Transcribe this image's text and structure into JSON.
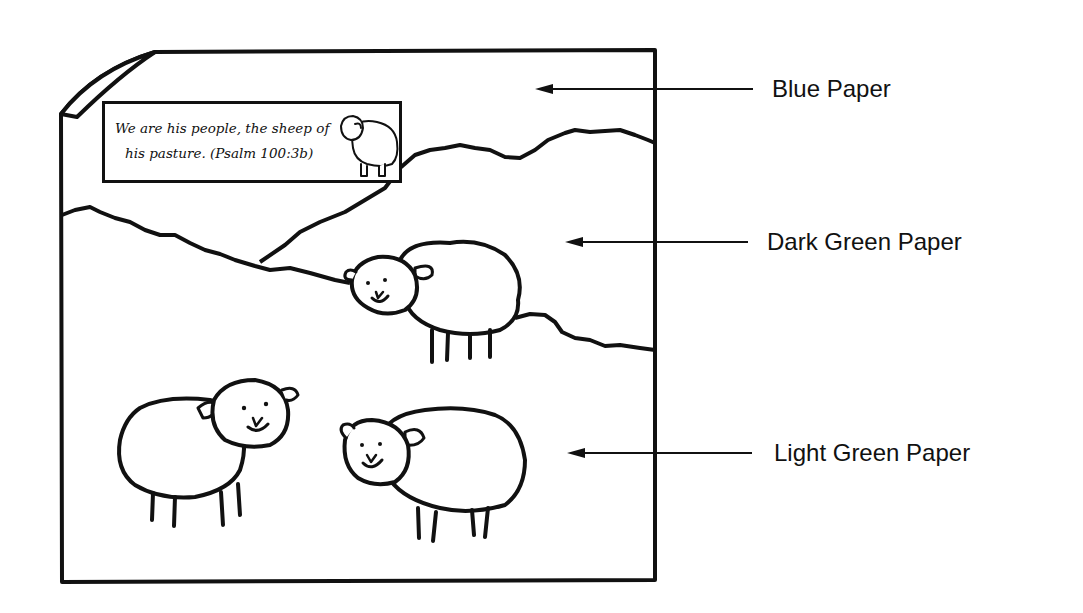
{
  "diagram": {
    "verse": {
      "line1": "We are his people, the sheep of",
      "line2": "his pasture. (Psalm 100:3b)"
    },
    "labels": [
      {
        "id": "blue",
        "text": "Blue Paper"
      },
      {
        "id": "dark-green",
        "text": "Dark Green Paper"
      },
      {
        "id": "light-green",
        "text": "Light Green Paper"
      }
    ],
    "colors": {
      "stroke": "#111111",
      "background": "#ffffff"
    }
  }
}
